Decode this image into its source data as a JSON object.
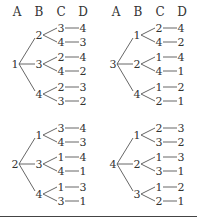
{
  "headers": [
    "A",
    "B",
    "C",
    "D"
  ],
  "trees": [
    {
      "root": "1",
      "branches": [
        {
          "b": "2",
          "leaves": [
            {
              "c": "3",
              "d": "4"
            },
            {
              "c": "4",
              "d": "3"
            }
          ]
        },
        {
          "b": "3",
          "leaves": [
            {
              "c": "2",
              "d": "4"
            },
            {
              "c": "4",
              "d": "2"
            }
          ]
        },
        {
          "b": "4",
          "leaves": [
            {
              "c": "2",
              "d": "3"
            },
            {
              "c": "3",
              "d": "2"
            }
          ]
        }
      ]
    },
    {
      "root": "3",
      "branches": [
        {
          "b": "1",
          "leaves": [
            {
              "c": "2",
              "d": "4"
            },
            {
              "c": "4",
              "d": "2"
            }
          ]
        },
        {
          "b": "2",
          "leaves": [
            {
              "c": "1",
              "d": "4"
            },
            {
              "c": "4",
              "d": "1"
            }
          ]
        },
        {
          "b": "4",
          "leaves": [
            {
              "c": "1",
              "d": "2"
            },
            {
              "c": "2",
              "d": "1"
            }
          ]
        }
      ]
    },
    {
      "root": "2",
      "branches": [
        {
          "b": "1",
          "leaves": [
            {
              "c": "3",
              "d": "4"
            },
            {
              "c": "4",
              "d": "3"
            }
          ]
        },
        {
          "b": "3",
          "leaves": [
            {
              "c": "1",
              "d": "4"
            },
            {
              "c": "4",
              "d": "1"
            }
          ]
        },
        {
          "b": "4",
          "leaves": [
            {
              "c": "1",
              "d": "3"
            },
            {
              "c": "3",
              "d": "1"
            }
          ]
        }
      ]
    },
    {
      "root": "4",
      "branches": [
        {
          "b": "1",
          "leaves": [
            {
              "c": "2",
              "d": "3"
            },
            {
              "c": "3",
              "d": "2"
            }
          ]
        },
        {
          "b": "2",
          "leaves": [
            {
              "c": "1",
              "d": "3"
            },
            {
              "c": "3",
              "d": "1"
            }
          ]
        },
        {
          "b": "3",
          "leaves": [
            {
              "c": "1",
              "d": "2"
            },
            {
              "c": "2",
              "d": "1"
            }
          ]
        }
      ]
    }
  ]
}
